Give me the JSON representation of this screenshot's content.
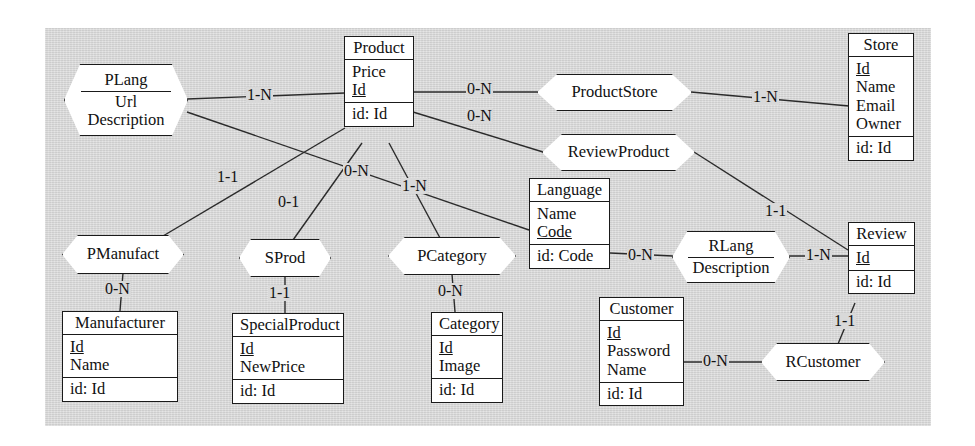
{
  "diagram": {
    "background_color": "#d9d9d9",
    "line_color": "#2b2b2b",
    "entity_fill": "#ffffff",
    "entities": [
      {
        "id": "product",
        "name": "Product",
        "attributes": [
          "Price",
          "Id"
        ],
        "key_attributes": [
          "Id"
        ],
        "identifier": "id: Id"
      },
      {
        "id": "store",
        "name": "Store",
        "attributes": [
          "Id",
          "Name",
          "Email",
          "Owner"
        ],
        "key_attributes": [
          "Id"
        ],
        "identifier": "id: Id"
      },
      {
        "id": "language",
        "name": "Language",
        "attributes": [
          "Name",
          "Code"
        ],
        "key_attributes": [
          "Code"
        ],
        "identifier": "id: Code"
      },
      {
        "id": "review",
        "name": "Review",
        "attributes": [
          "Id"
        ],
        "key_attributes": [
          "Id"
        ],
        "identifier": "id: Id"
      },
      {
        "id": "manufacturer",
        "name": "Manufacturer",
        "attributes": [
          "Id",
          "Name"
        ],
        "key_attributes": [
          "Id"
        ],
        "identifier": "id: Id"
      },
      {
        "id": "specialproduct",
        "name": "SpecialProduct",
        "attributes": [
          "Id",
          "NewPrice"
        ],
        "key_attributes": [
          "Id"
        ],
        "identifier": "id: Id"
      },
      {
        "id": "category",
        "name": "Category",
        "attributes": [
          "Id",
          "Image"
        ],
        "key_attributes": [
          "Id"
        ],
        "identifier": "id: Id"
      },
      {
        "id": "customer",
        "name": "Customer",
        "attributes": [
          "Id",
          "Password",
          "Name"
        ],
        "key_attributes": [
          "Id"
        ],
        "identifier": "id: Id"
      }
    ],
    "relationships": [
      {
        "id": "plang",
        "name": "PLang",
        "attributes": [
          "Url",
          "Description"
        ]
      },
      {
        "id": "productstore",
        "name": "ProductStore",
        "attributes": []
      },
      {
        "id": "reviewproduct",
        "name": "ReviewProduct",
        "attributes": []
      },
      {
        "id": "rlang",
        "name": "RLang",
        "attributes": [
          "Description"
        ]
      },
      {
        "id": "pmanufact",
        "name": "PManufact",
        "attributes": []
      },
      {
        "id": "sprod",
        "name": "SProd",
        "attributes": []
      },
      {
        "id": "pcategory",
        "name": "PCategory",
        "attributes": []
      },
      {
        "id": "rcustomer",
        "name": "RCustomer",
        "attributes": []
      }
    ],
    "cardinalities": [
      {
        "id": "c1",
        "label": "1-N",
        "from": "plang",
        "to": "product"
      },
      {
        "id": "c2",
        "label": "0-N",
        "from": "product",
        "to": "productstore"
      },
      {
        "id": "c3",
        "label": "0-N",
        "from": "product",
        "to": "reviewproduct"
      },
      {
        "id": "c4",
        "label": "1-N",
        "from": "productstore",
        "to": "store"
      },
      {
        "id": "c5",
        "label": "1-1",
        "from": "pmanufact",
        "to": "product"
      },
      {
        "id": "c6",
        "label": "0-1",
        "from": "sprod",
        "to": "product"
      },
      {
        "id": "c7",
        "label": "0-N",
        "from": "plang",
        "to": "language"
      },
      {
        "id": "c8",
        "label": "1-N",
        "from": "product",
        "to": "pcategory"
      },
      {
        "id": "c9",
        "label": "1-1",
        "from": "reviewproduct",
        "to": "review"
      },
      {
        "id": "c10",
        "label": "0-N",
        "from": "language",
        "to": "rlang"
      },
      {
        "id": "c11",
        "label": "1-N",
        "from": "rlang",
        "to": "review"
      },
      {
        "id": "c12",
        "label": "0-N",
        "from": "pmanufact",
        "to": "manufacturer"
      },
      {
        "id": "c13",
        "label": "1-1",
        "from": "sprod",
        "to": "specialproduct"
      },
      {
        "id": "c14",
        "label": "0-N",
        "from": "pcategory",
        "to": "category"
      },
      {
        "id": "c15",
        "label": "1-1",
        "from": "rcustomer",
        "to": "review"
      },
      {
        "id": "c16",
        "label": "0-N",
        "from": "customer",
        "to": "rcustomer"
      }
    ]
  }
}
